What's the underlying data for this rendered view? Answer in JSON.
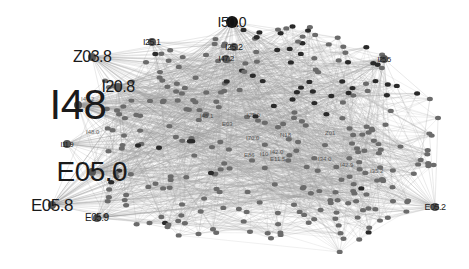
{
  "graph": {
    "type": "network",
    "edge_color": "#9a9a9a",
    "node_color": "#6b6b6b",
    "dark_node_color": "#2a2a2a",
    "background": "#ffffff",
    "hubs": [
      {
        "id": "I48",
        "label": "I48",
        "x": 78,
        "y": 105,
        "size": 42
      },
      {
        "id": "E05.0",
        "label": "E05.0",
        "x": 92,
        "y": 172,
        "size": 28
      },
      {
        "id": "E05.8",
        "label": "E05.8",
        "x": 52,
        "y": 205,
        "size": 17
      },
      {
        "id": "Z03.8",
        "label": "Z03.8",
        "x": 92,
        "y": 57,
        "size": 16
      },
      {
        "id": "I20.8",
        "label": "I20.8",
        "x": 118,
        "y": 87,
        "size": 16
      },
      {
        "id": "I50.0",
        "label": "I50.0",
        "x": 232,
        "y": 22,
        "size": 14
      },
      {
        "id": "E05.9",
        "label": "E05.9",
        "x": 97,
        "y": 218,
        "size": 10
      },
      {
        "id": "I25.1",
        "label": "I25.1",
        "x": 152,
        "y": 42,
        "size": 9
      },
      {
        "id": "I25.2",
        "label": "I25.2",
        "x": 234,
        "y": 47,
        "size": 9
      },
      {
        "id": "I47.2",
        "label": "I47.2",
        "x": 226,
        "y": 59,
        "size": 8
      },
      {
        "id": "I25.5",
        "label": "I25.5",
        "x": 384,
        "y": 59,
        "size": 7
      },
      {
        "id": "E05.2",
        "label": "E05.2",
        "x": 435,
        "y": 207,
        "size": 9
      },
      {
        "id": "I11.9",
        "label": "I11.9",
        "x": 67,
        "y": 144,
        "size": 7
      }
    ],
    "minor_labels": [
      {
        "label": "I47.2",
        "x": 81,
        "y": 99
      },
      {
        "label": "I48.0",
        "x": 86,
        "y": 132
      },
      {
        "label": "I70.0",
        "x": 246,
        "y": 138
      },
      {
        "label": "E03",
        "x": 222,
        "y": 124
      },
      {
        "label": "I25.0",
        "x": 247,
        "y": 115
      },
      {
        "label": "E86",
        "x": 244,
        "y": 155
      },
      {
        "label": "I10",
        "x": 260,
        "y": 154
      },
      {
        "label": "I42.0",
        "x": 270,
        "y": 152
      },
      {
        "label": "E11.5",
        "x": 270,
        "y": 159
      },
      {
        "label": "I34.0",
        "x": 318,
        "y": 159
      },
      {
        "label": "Z01",
        "x": 325,
        "y": 133
      },
      {
        "label": "I35.2",
        "x": 370,
        "y": 171
      },
      {
        "label": "I42.9",
        "x": 340,
        "y": 165
      },
      {
        "label": "I45.1",
        "x": 200,
        "y": 116
      },
      {
        "label": "N18",
        "x": 280,
        "y": 135
      }
    ],
    "layout": {
      "cloud_center_x": 255,
      "cloud_center_y": 140,
      "cloud_radius_x": 165,
      "cloud_radius_y": 110,
      "node_count": 300,
      "seed": 42
    }
  }
}
